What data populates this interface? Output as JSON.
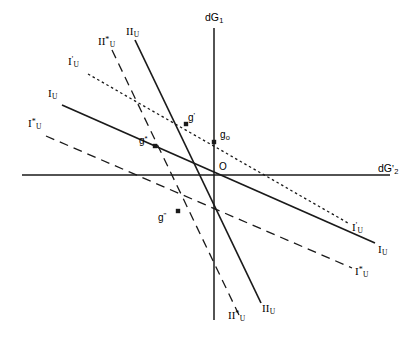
{
  "figure": {
    "width": 416,
    "height": 338,
    "background": "#ffffff",
    "ink": "#1a1a1a"
  },
  "axes": {
    "vertical": {
      "label": "dG",
      "label_sub": "1",
      "label_prime": "",
      "x": 214,
      "y_top": 28,
      "y_bottom": 320
    },
    "horizontal": {
      "label": "dG",
      "label_sub": "2",
      "label_prime": "'",
      "y": 175,
      "x_left": 22,
      "x_right": 390
    },
    "origin_label": "O",
    "origin_x": 214,
    "origin_y": 175
  },
  "chart_data": {
    "type": "line",
    "title": "",
    "xlabel": "dG'2",
    "ylabel": "dG1",
    "grid": false,
    "legend": "inline-end-labels",
    "origin": [
      214,
      175
    ],
    "series": [
      {
        "name": "I_U",
        "label": "I",
        "label_sub": "U",
        "label_sup": "",
        "style": "solid",
        "x1": 62,
        "y1": 105,
        "x2": 375,
        "y2": 243,
        "label_start_x": 48,
        "label_start_y": 88,
        "label_end_x": 378,
        "label_end_y": 244
      },
      {
        "name": "I_U_star",
        "label": "I",
        "label_sub": "U",
        "label_sup": "*",
        "style": "dashed",
        "x1": 46,
        "y1": 136,
        "x2": 352,
        "y2": 268,
        "label_start_x": 28,
        "label_start_y": 118,
        "label_end_x": 355,
        "label_end_y": 266
      },
      {
        "name": "I_U_prime",
        "label": "I",
        "label_sub": "U",
        "label_sup": "'",
        "style": "dotted",
        "x1": 88,
        "y1": 74,
        "x2": 348,
        "y2": 223,
        "label_start_x": 68,
        "label_start_y": 56,
        "label_end_x": 352,
        "label_end_y": 222
      },
      {
        "name": "II_U",
        "label": "II",
        "label_sub": "U",
        "label_sup": "",
        "style": "solid",
        "x1": 135,
        "y1": 40,
        "x2": 261,
        "y2": 303,
        "label_start_x": 126,
        "label_start_y": 26,
        "label_end_x": 262,
        "label_end_y": 303
      },
      {
        "name": "II_U_star",
        "label": "II",
        "label_sub": "U",
        "label_sup": "*",
        "style": "dashed",
        "x1": 112,
        "y1": 50,
        "x2": 239,
        "y2": 315,
        "label_start_x": 98,
        "label_start_y": 36,
        "label_end_x": 228,
        "label_end_y": 310
      }
    ],
    "points": [
      {
        "name": "g_prime",
        "label": "g",
        "sup": "'",
        "sub": "",
        "x": 186,
        "y": 124,
        "label_dx": 2,
        "label_dy": -12
      },
      {
        "name": "g_star",
        "label": "g",
        "sup": "*",
        "sub": "",
        "x": 155,
        "y": 146,
        "label_dx": -16,
        "label_dy": -11
      },
      {
        "name": "g_zero",
        "label": "g",
        "sup": "",
        "sub": "o",
        "x": 214,
        "y": 142,
        "label_dx": 6,
        "label_dy": -12
      },
      {
        "name": "g_double_prime",
        "label": "g",
        "sup": "\"",
        "sub": "",
        "x": 178,
        "y": 211,
        "label_dx": -20,
        "label_dy": 1
      }
    ]
  }
}
